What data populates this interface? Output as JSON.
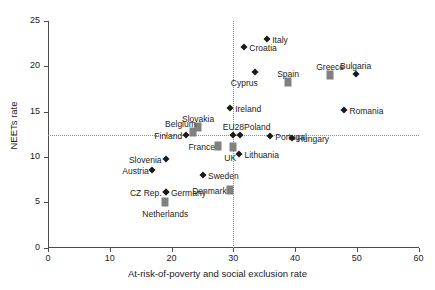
{
  "chart_data": {
    "type": "scatter",
    "title": "",
    "xlabel": "At-risk-of-poverty and social exclusion rate",
    "ylabel": "NEETs rate",
    "xlim": [
      0,
      60
    ],
    "ylim": [
      0,
      25
    ],
    "xticks": [
      0,
      10,
      20,
      30,
      40,
      50,
      60
    ],
    "yticks": [
      0,
      5,
      10,
      15,
      20,
      25
    ],
    "grid": false,
    "legend": "none",
    "reference_lines": [
      {
        "orientation": "horizontal",
        "value": 12.4,
        "style": "dotted"
      },
      {
        "orientation": "vertical",
        "value": 30.0,
        "style": "dotted"
      }
    ],
    "marker_styles": {
      "diamond": "black diamond",
      "square": "grey square"
    },
    "points": [
      {
        "label": "Italy",
        "x": 35.5,
        "y": 23.0,
        "marker": "diamond",
        "label_pos": "right"
      },
      {
        "label": "Croatia",
        "x": 31.8,
        "y": 22.1,
        "marker": "diamond",
        "label_pos": "right"
      },
      {
        "label": "Cyprus",
        "x": 33.5,
        "y": 19.4,
        "marker": "diamond",
        "label_pos": "below-left"
      },
      {
        "label": "Spain",
        "x": 38.9,
        "y": 18.3,
        "marker": "square",
        "label_pos": "above"
      },
      {
        "label": "Greece",
        "x": 45.7,
        "y": 19.0,
        "marker": "square",
        "label_pos": "above"
      },
      {
        "label": "Bulgaria",
        "x": 49.8,
        "y": 19.2,
        "marker": "diamond",
        "label_pos": "above"
      },
      {
        "label": "Romania",
        "x": 48.0,
        "y": 15.2,
        "marker": "diamond",
        "label_pos": "right"
      },
      {
        "label": "Ireland",
        "x": 29.5,
        "y": 15.4,
        "marker": "diamond",
        "label_pos": "right"
      },
      {
        "label": "Slovakia",
        "x": 24.3,
        "y": 13.3,
        "marker": "square",
        "label_pos": "above"
      },
      {
        "label": "Belgium",
        "x": 23.5,
        "y": 12.7,
        "marker": "square",
        "label_pos": "above-left"
      },
      {
        "label": "Finland",
        "x": 22.4,
        "y": 12.4,
        "marker": "diamond",
        "label_pos": "left"
      },
      {
        "label": "EU28",
        "x": 30.0,
        "y": 12.4,
        "marker": "diamond",
        "label_pos": "above"
      },
      {
        "label": "Poland",
        "x": 31.1,
        "y": 12.4,
        "marker": "diamond",
        "label_pos": "above-right"
      },
      {
        "label": "Portugal",
        "x": 36.0,
        "y": 12.3,
        "marker": "diamond",
        "label_pos": "right"
      },
      {
        "label": "Hungary",
        "x": 39.5,
        "y": 12.1,
        "marker": "diamond",
        "label_pos": "right"
      },
      {
        "label": "France",
        "x": 27.6,
        "y": 11.2,
        "marker": "square",
        "label_pos": "left"
      },
      {
        "label": "UK",
        "x": 30.0,
        "y": 11.1,
        "marker": "square",
        "label_pos": "below-left"
      },
      {
        "label": "Lithuania",
        "x": 31.0,
        "y": 10.3,
        "marker": "diamond",
        "label_pos": "right"
      },
      {
        "label": "Slovenia",
        "x": 19.1,
        "y": 9.8,
        "marker": "diamond",
        "label_pos": "left"
      },
      {
        "label": "Austria",
        "x": 16.9,
        "y": 8.6,
        "marker": "diamond",
        "label_pos": "left"
      },
      {
        "label": "Sweden",
        "x": 25.1,
        "y": 8.0,
        "marker": "diamond",
        "label_pos": "right"
      },
      {
        "label": "Germany",
        "x": 19.1,
        "y": 6.1,
        "marker": "diamond",
        "label_pos": "right"
      },
      {
        "label": "CZ Rep.",
        "x": 19.1,
        "y": 6.1,
        "marker": "diamond",
        "label_pos": "left"
      },
      {
        "label": "Denmark",
        "x": 29.5,
        "y": 6.4,
        "marker": "square",
        "label_pos": "left"
      },
      {
        "label": "Netherlands",
        "x": 19.0,
        "y": 5.0,
        "marker": "square",
        "label_pos": "below"
      }
    ]
  },
  "axis": {
    "x_title": "At-risk-of-poverty and social exclusion rate",
    "y_title": "NEETs rate",
    "x_ticklabels": [
      "0",
      "10",
      "20",
      "30",
      "40",
      "50",
      "60"
    ],
    "y_ticklabels": [
      "0",
      "5",
      "10",
      "15",
      "20",
      "25"
    ]
  }
}
